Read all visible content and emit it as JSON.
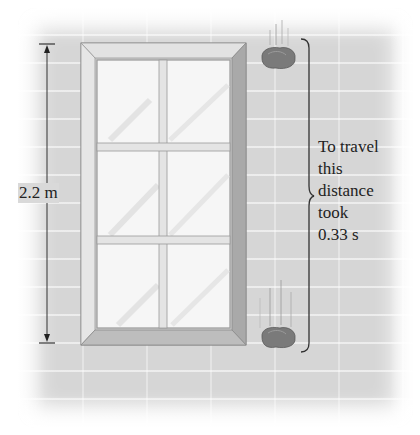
{
  "figure": {
    "height_label": "2.2 m",
    "caption_lines": [
      "To travel",
      "this",
      "distance",
      "took",
      "0.33 s"
    ],
    "objects": {
      "window": {
        "panes_rows": 3,
        "panes_cols": 2
      },
      "rocks": [
        {
          "position": "top",
          "label": "falling-rock-start"
        },
        {
          "position": "bottom",
          "label": "falling-rock-end"
        }
      ]
    },
    "colors": {
      "wall": "#d6d6d6",
      "frame": "#c8c8c8",
      "glass": "#f6f6f6",
      "rock": "#7a7a7a",
      "ink": "#222222"
    }
  }
}
